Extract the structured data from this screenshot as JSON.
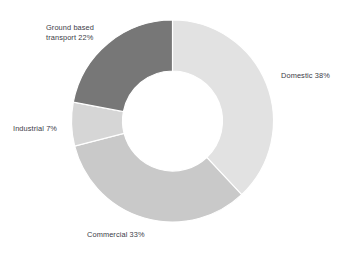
{
  "chart_data": {
    "type": "pie",
    "variant": "donut",
    "title": "",
    "subtitle": "",
    "xlabel": "",
    "ylabel": "",
    "legend_position": "none",
    "grid": false,
    "units": "percent",
    "hole_ratio": 0.5,
    "start_angle_deg": 0,
    "direction": "clockwise",
    "categories": [
      "Domestic",
      "Commercial",
      "Industrial",
      "Ground based transport"
    ],
    "values": [
      38,
      33,
      7,
      22
    ],
    "slices": [
      {
        "name": "Domestic",
        "value": 38,
        "label": "Domestic 38%",
        "color": "#e2e2e2",
        "start_pct": 0,
        "end_pct": 38
      },
      {
        "name": "Commercial",
        "value": 33,
        "label": "Commercial 33%",
        "color": "#c9c9c9",
        "start_pct": 38,
        "end_pct": 71
      },
      {
        "name": "Industrial",
        "value": 7,
        "label": "Industrial 7%",
        "color": "#d6d6d6",
        "start_pct": 71,
        "end_pct": 78
      },
      {
        "name": "Ground based transport",
        "value": 22,
        "label": "Ground based\ntransport 22%",
        "color": "#777777",
        "start_pct": 78,
        "end_pct": 100
      }
    ]
  },
  "labels": {
    "ground_based_transport": "Ground based\ntransport 22%",
    "domestic": "Domestic 38%",
    "industrial": "Industrial 7%",
    "commercial": "Commercial 33%"
  },
  "colors": {
    "background": "#ffffff",
    "text": "#3b3b47",
    "domestic": "#e2e2e2",
    "commercial": "#c9c9c9",
    "industrial": "#d6d6d6",
    "ground_based_transport": "#777777",
    "slice_gap": "#ffffff"
  },
  "geometry": {
    "center_x": 172.5,
    "center_y": 121,
    "outer_radius": 101,
    "inner_radius": 50
  }
}
